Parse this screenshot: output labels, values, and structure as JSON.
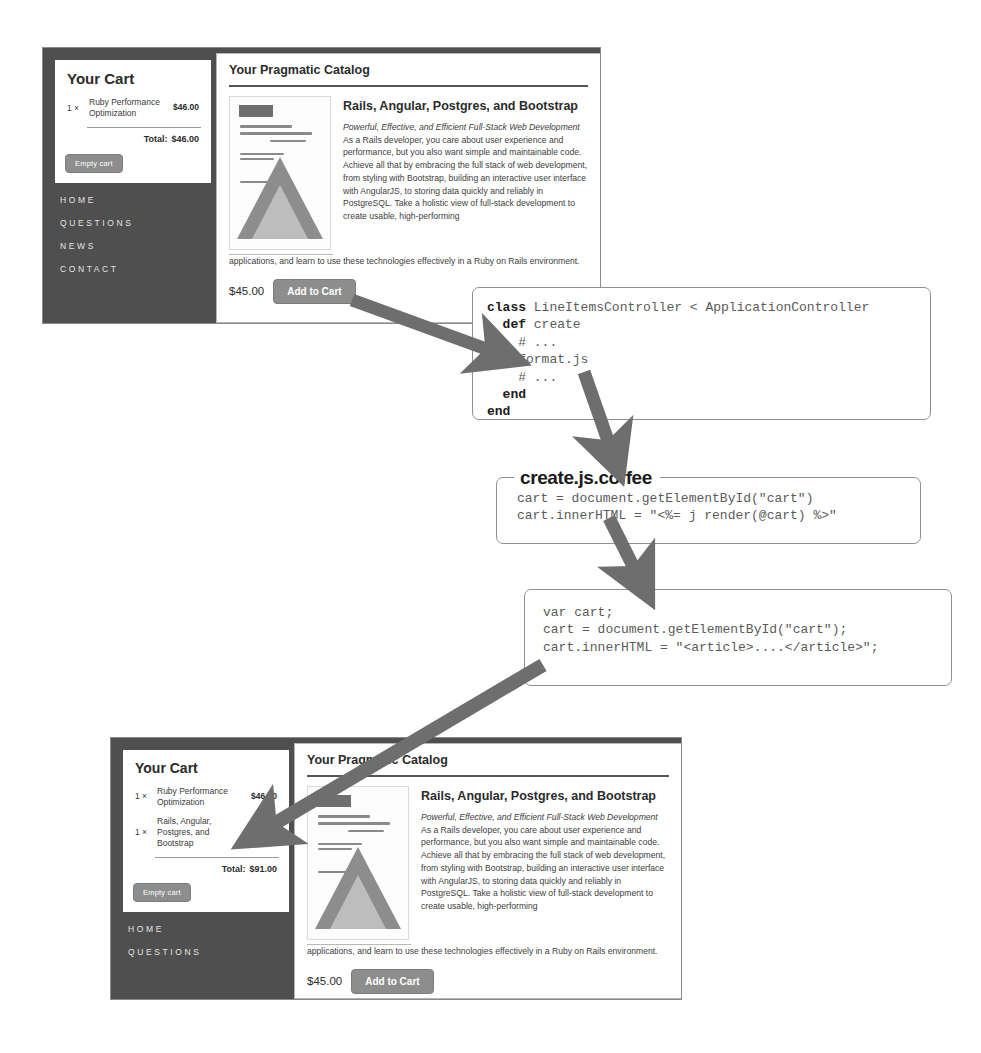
{
  "diagram": {
    "arrow_color": "#6e6e6e"
  },
  "screenshots": [
    {
      "id": "before",
      "cart": {
        "heading": "Your Cart",
        "items": [
          {
            "qty": "1 ×",
            "title": "Ruby Performance Optimization",
            "price": "$46.00"
          }
        ],
        "total_label": "Total:",
        "total_value": "$46.00",
        "empty_button": "Empty cart"
      },
      "nav": [
        "HOME",
        "QUESTIONS",
        "NEWS",
        "CONTACT"
      ],
      "catalog": {
        "heading": "Your Pragmatic Catalog",
        "book_title": "Rails, Angular, Postgres, and Bootstrap",
        "book_subtitle": "Powerful, Effective, and Efficient Full-Stack Web Development",
        "book_desc": " As a Rails developer, you care about user experience and performance, but you also want simple and maintainable code. Achieve all that by embracing the full stack of web development, from styling with Bootstrap, building an interactive user interface with AngularJS, to storing data quickly and reliably in PostgreSQL. Take a holistic view of full-stack development to create usable, high-performing",
        "book_desc_tail": "applications, and learn to use these technologies effectively in a Ruby on Rails environment.",
        "price": "$45.00",
        "add_button": "Add to Cart",
        "cover_alt": "Rails, Angular, Postgres, and Bootstrap book cover"
      }
    },
    {
      "id": "after",
      "cart": {
        "heading": "Your Cart",
        "items": [
          {
            "qty": "1 ×",
            "title": "Ruby Performance Optimization",
            "price": "$46.00"
          },
          {
            "qty": "1 ×",
            "title": "Rails, Angular, Postgres, and Bootstrap",
            "price": "$45.00"
          }
        ],
        "total_label": "Total:",
        "total_value": "$91.00",
        "empty_button": "Empty cart"
      },
      "nav": [
        "HOME",
        "QUESTIONS"
      ],
      "catalog": {
        "heading": "Your Pragmatic Catalog",
        "book_title": "Rails, Angular, Postgres, and Bootstrap",
        "book_subtitle": "Powerful, Effective, and Efficient Full-Stack Web Development",
        "book_desc": " As a Rails developer, you care about user experience and performance, but you also want simple and maintainable code. Achieve all that by embracing the full stack of web development, from styling with Bootstrap, building an interactive user interface with AngularJS, to storing data quickly and reliably in PostgreSQL. Take a holistic view of full-stack development to create usable, high-performing",
        "book_desc_tail": "applications, and learn to use these technologies effectively in a Ruby on Rails environment.",
        "price": "$45.00",
        "add_button": "Add to Cart",
        "cover_alt": "Rails, Angular, Postgres, and Bootstrap book cover"
      }
    }
  ],
  "code_blocks": [
    {
      "id": "controller",
      "legend": "",
      "lines": [
        {
          "kw": "class",
          "rest": " LineItemsController < ApplicationController"
        },
        {
          "kw": "  def",
          "rest": " create"
        },
        {
          "kw": "",
          "rest": "    # ..."
        },
        {
          "kw": "",
          "rest": "    format.js"
        },
        {
          "kw": "",
          "rest": "    # ..."
        },
        {
          "kw": "  end",
          "rest": ""
        },
        {
          "kw": "end",
          "rest": ""
        }
      ]
    },
    {
      "id": "coffee",
      "legend": "create.js.coffee",
      "lines": [
        {
          "kw": "",
          "rest": "cart = document.getElementById(\"cart\")"
        },
        {
          "kw": "",
          "rest": "cart.innerHTML = \"<%= j render(@cart) %>\""
        }
      ]
    },
    {
      "id": "compiled-js",
      "legend": "",
      "lines": [
        {
          "kw": "",
          "rest": "var cart;"
        },
        {
          "kw": "",
          "rest": "cart = document.getElementById(\"cart\");"
        },
        {
          "kw": "",
          "rest": "cart.innerHTML = \"<article>....</article>\";"
        }
      ]
    }
  ]
}
